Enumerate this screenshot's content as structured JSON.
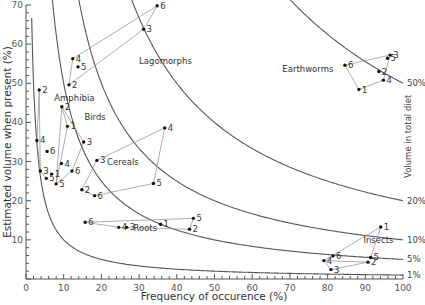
{
  "chart_data": {
    "type": "scatter",
    "title": "",
    "xlabel": "Frequency of occurence (%)",
    "ylabel": "Estimated volume when present (%)",
    "right_label": "Volume in total diet",
    "xlim": [
      0,
      100
    ],
    "ylim": [
      0,
      70
    ],
    "x_ticks": [
      0,
      10,
      20,
      30,
      40,
      50,
      60,
      70,
      80,
      90,
      100
    ],
    "y_ticks": [
      10,
      20,
      30,
      40,
      50,
      60,
      70
    ],
    "grid": false,
    "isopleths": [
      {
        "label": "50%",
        "product": 5000
      },
      {
        "label": "20%",
        "product": 2000
      },
      {
        "label": "10%",
        "product": 1000
      },
      {
        "label": "5%",
        "product": 500
      },
      {
        "label": "1%",
        "product": 100
      }
    ],
    "series": [
      {
        "name": "Lagomorphs",
        "label_pos": [
          30,
          55
        ],
        "points": [
          {
            "id": "2",
            "x": 11.4,
            "y": 49.6
          },
          {
            "id": "4",
            "x": 12.4,
            "y": 56.3
          },
          {
            "id": "5",
            "x": 13.8,
            "y": 54.2
          },
          {
            "id": "3",
            "x": 31.2,
            "y": 63.8
          },
          {
            "id": "6",
            "x": 34.8,
            "y": 69.8
          }
        ],
        "connections": [
          [
            "2",
            "3"
          ],
          [
            "4",
            "6"
          ],
          [
            "2",
            "4"
          ],
          [
            "3",
            "6"
          ]
        ]
      },
      {
        "name": "Amphibia",
        "label_pos": [
          7.5,
          45.5
        ],
        "points": [
          {
            "id": "2",
            "x": 3.5,
            "y": 48.3
          },
          {
            "id": "4",
            "x": 2.9,
            "y": 35.4
          },
          {
            "id": "6",
            "x": 5.6,
            "y": 32.6
          },
          {
            "id": "3",
            "x": 3.8,
            "y": 27.6
          },
          {
            "id": "5",
            "x": 5.4,
            "y": 25.7
          },
          {
            "id": "1",
            "x": 6.8,
            "y": 26.8
          }
        ],
        "connections": [
          [
            "2",
            "4"
          ],
          [
            "4",
            "3"
          ],
          [
            "3",
            "5"
          ],
          [
            "2",
            "3"
          ]
        ]
      },
      {
        "name": "Birds",
        "label_pos": [
          15.5,
          40.5
        ],
        "points": [
          {
            "id": "2",
            "x": 9.5,
            "y": 44.0
          },
          {
            "id": "1",
            "x": 11.0,
            "y": 39.0
          },
          {
            "id": "3",
            "x": 15.3,
            "y": 35.0
          },
          {
            "id": "4",
            "x": 9.4,
            "y": 29.5
          },
          {
            "id": "6",
            "x": 12.2,
            "y": 27.6
          },
          {
            "id": "5",
            "x": 8.0,
            "y": 24.3
          }
        ],
        "connections": [
          [
            "2",
            "1"
          ],
          [
            "1",
            "5"
          ],
          [
            "2",
            "3"
          ],
          [
            "3",
            "6"
          ],
          [
            "6",
            "5"
          ],
          [
            "2",
            "5"
          ]
        ]
      },
      {
        "name": "Cereals",
        "label_pos": [
          21.5,
          29
        ],
        "points": [
          {
            "id": "3",
            "x": 18.8,
            "y": 30.3
          },
          {
            "id": "4",
            "x": 36.8,
            "y": 38.6
          },
          {
            "id": "2",
            "x": 14.8,
            "y": 22.8
          },
          {
            "id": "6",
            "x": 18.2,
            "y": 21.3
          },
          {
            "id": "5",
            "x": 33.8,
            "y": 24.4
          }
        ],
        "connections": [
          [
            "3",
            "4"
          ],
          [
            "4",
            "5"
          ],
          [
            "5",
            "6"
          ],
          [
            "6",
            "2"
          ],
          [
            "2",
            "3"
          ]
        ]
      },
      {
        "name": "Roots",
        "label_pos": [
          28.5,
          12.2
        ],
        "points": [
          {
            "id": "6",
            "x": 15.7,
            "y": 14.5
          },
          {
            "id": "4",
            "x": 24.6,
            "y": 13.2
          },
          {
            "id": "3",
            "x": 26.7,
            "y": 13.2
          },
          {
            "id": "1",
            "x": 35.7,
            "y": 14.0
          },
          {
            "id": "5",
            "x": 44.4,
            "y": 15.5
          },
          {
            "id": "2",
            "x": 43.4,
            "y": 12.7
          }
        ],
        "connections": [
          [
            "6",
            "5"
          ],
          [
            "6",
            "4"
          ],
          [
            "4",
            "2"
          ],
          [
            "5",
            "2"
          ]
        ]
      },
      {
        "name": "Earthworms",
        "label_pos": [
          68,
          53
        ],
        "points": [
          {
            "id": "6",
            "x": 84.6,
            "y": 54.6
          },
          {
            "id": "3",
            "x": 96.6,
            "y": 57.2
          },
          {
            "id": "5",
            "x": 95.9,
            "y": 56.4
          },
          {
            "id": "2",
            "x": 93.6,
            "y": 53.0
          },
          {
            "id": "4",
            "x": 94.8,
            "y": 50.8
          },
          {
            "id": "1",
            "x": 88.3,
            "y": 48.4
          }
        ],
        "connections": [
          [
            "6",
            "3"
          ],
          [
            "3",
            "4"
          ],
          [
            "4",
            "1"
          ],
          [
            "1",
            "6"
          ]
        ]
      },
      {
        "name": "Insects",
        "label_pos": [
          89.5,
          9.2
        ],
        "points": [
          {
            "id": "1",
            "x": 94.1,
            "y": 13.3
          },
          {
            "id": "6",
            "x": 81.4,
            "y": 5.9
          },
          {
            "id": "4",
            "x": 79.0,
            "y": 4.7
          },
          {
            "id": "3",
            "x": 80.9,
            "y": 2.4
          },
          {
            "id": "5",
            "x": 91.4,
            "y": 5.5
          },
          {
            "id": "2",
            "x": 90.7,
            "y": 4.3
          }
        ],
        "connections": [
          [
            "1",
            "4"
          ],
          [
            "1",
            "5"
          ],
          [
            "4",
            "2"
          ],
          [
            "4",
            "3"
          ],
          [
            "3",
            "2"
          ]
        ]
      }
    ]
  },
  "axes": {
    "x_ticks_labels": [
      "0",
      "10",
      "20",
      "30",
      "40",
      "50",
      "60",
      "70",
      "80",
      "90",
      "100"
    ],
    "y_ticks_labels": [
      "10",
      "20",
      "30",
      "40",
      "50",
      "60",
      "70"
    ]
  }
}
